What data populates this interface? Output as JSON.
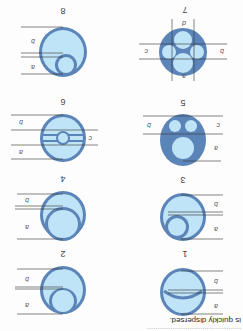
{
  "document": {
    "orientation": "rotated 180 degrees",
    "caption_fragment": "is quickly dispersed.",
    "faint_line_fragment": "............................................"
  },
  "figures": [
    {
      "number": "1",
      "dims": [
        "b",
        "a"
      ]
    },
    {
      "number": "2",
      "dims": [
        "b",
        "a"
      ]
    },
    {
      "number": "3",
      "dims": [
        "b",
        "a"
      ]
    },
    {
      "number": "4",
      "dims": [
        "b",
        "a"
      ]
    },
    {
      "number": "5",
      "dims": [
        "b",
        "c",
        "a"
      ]
    },
    {
      "number": "6",
      "dims": [
        "b",
        "c",
        "a"
      ]
    },
    {
      "number": "7",
      "dims": [
        "b",
        "c",
        "a",
        "d"
      ]
    },
    {
      "number": "8",
      "dims": [
        "b",
        "a"
      ]
    }
  ],
  "colors": {
    "sheath": "#5b84b8",
    "core": "#bfe3f7",
    "dim_line": "#333333"
  }
}
